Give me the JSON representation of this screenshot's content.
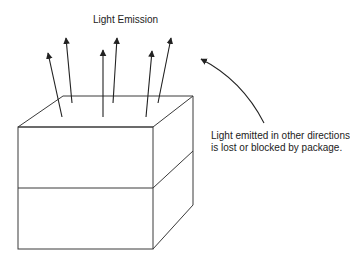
{
  "diagram": {
    "title_label": "Light Emission",
    "note_line1": "Light emitted in other directions",
    "note_line2": "is lost or blocked by package.",
    "colors": {
      "line": "#3a3a3a",
      "text": "#222222",
      "background": "#ffffff"
    },
    "elements": {
      "package": "box-shape (rectangular package drawn as 3D box, split into two layers)",
      "emission_arrows": 6,
      "lost_light_arrow": "curved arrow pointing up-left toward package"
    }
  }
}
